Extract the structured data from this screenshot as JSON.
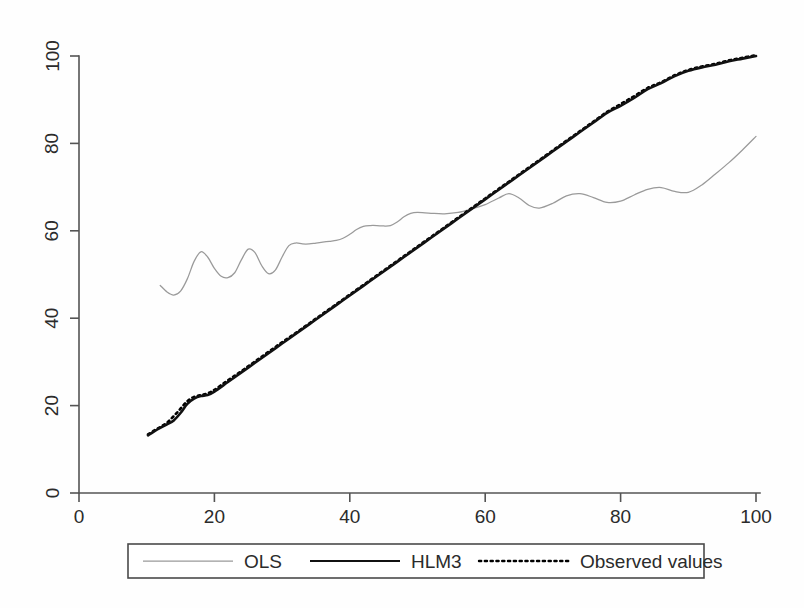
{
  "chart_data": {
    "type": "line",
    "title": "",
    "subtitle": "",
    "xlabel": "",
    "ylabel": "",
    "xlim": [
      0,
      100
    ],
    "ylim": [
      0,
      100
    ],
    "grid": false,
    "legend_position": "bottom-center",
    "x_ticks": [
      "0",
      "20",
      "40",
      "60",
      "80",
      "100"
    ],
    "y_ticks": [
      "0",
      "20",
      "40",
      "60",
      "80",
      "100"
    ],
    "x_tick_values": [
      0,
      20,
      40,
      60,
      80,
      100
    ],
    "y_tick_values": [
      0,
      20,
      40,
      60,
      80,
      100
    ],
    "series": [
      {
        "name": "OLS",
        "style": "thin-gray-solid",
        "color": "#9a9a9a",
        "x": [
          12.0,
          13.0,
          14.0,
          15.0,
          16.0,
          17.0,
          18.0,
          19.0,
          20.0,
          21.0,
          22.0,
          23.0,
          24.0,
          25.0,
          26.0,
          27.0,
          28.0,
          29.0,
          30.0,
          31.0,
          32.0,
          33.0,
          34.0,
          35.0,
          36.0,
          37.0,
          38.0,
          39.0,
          40.0,
          41.0,
          42.0,
          43.0,
          44.0,
          45.0,
          46.0,
          47.0,
          48.0,
          49.0,
          50.0,
          52.0,
          54.0,
          56.0,
          58.0,
          60.0,
          62.0,
          63.5,
          65.0,
          66.5,
          68.0,
          70.0,
          72.0,
          74.0,
          76.0,
          78.0,
          80.0,
          82.0,
          84.0,
          86.0,
          88.0,
          90.0,
          92.0,
          94.0,
          96.0,
          98.0,
          100.0
        ],
        "y": [
          47.5,
          46.0,
          45.3,
          46.2,
          49.0,
          53.0,
          55.2,
          54.0,
          51.4,
          49.6,
          49.3,
          50.4,
          53.4,
          55.8,
          55.0,
          52.0,
          50.2,
          51.0,
          54.0,
          56.6,
          57.2,
          57.0,
          57.0,
          57.2,
          57.4,
          57.6,
          57.8,
          58.3,
          59.2,
          60.3,
          61.0,
          61.2,
          61.2,
          61.1,
          61.2,
          62.0,
          63.2,
          64.0,
          64.2,
          64.0,
          63.9,
          64.2,
          65.0,
          66.0,
          67.5,
          68.5,
          67.5,
          65.8,
          65.2,
          66.3,
          68.0,
          68.5,
          67.6,
          66.5,
          66.8,
          68.2,
          69.5,
          69.9,
          69.0,
          68.8,
          70.5,
          73.0,
          75.6,
          78.5,
          81.6
        ]
      },
      {
        "name": "HLM3",
        "style": "thick-black-solid",
        "color": "#111111",
        "x": [
          10.2,
          11.0,
          12.0,
          13.0,
          14.0,
          15.0,
          16.0,
          17.0,
          18.0,
          19.0,
          20.0,
          22.0,
          24.0,
          26.0,
          28.0,
          30.0,
          32.0,
          34.0,
          36.0,
          38.0,
          40.0,
          42.0,
          44.0,
          46.0,
          48.0,
          50.0,
          52.0,
          54.0,
          56.0,
          58.0,
          60.0,
          62.0,
          64.0,
          66.0,
          68.0,
          70.0,
          72.0,
          74.0,
          76.0,
          78.0,
          80.0,
          82.0,
          84.0,
          86.0,
          88.0,
          90.0,
          92.0,
          94.0,
          96.0,
          98.0,
          100.0
        ],
        "y": [
          13.2,
          14.0,
          14.9,
          15.7,
          16.6,
          18.3,
          20.4,
          21.6,
          22.2,
          22.4,
          23.2,
          25.4,
          27.6,
          29.8,
          32.0,
          34.2,
          36.4,
          38.6,
          40.8,
          43.0,
          45.2,
          47.4,
          49.6,
          51.8,
          54.0,
          56.2,
          58.4,
          60.6,
          62.8,
          65.0,
          67.2,
          69.4,
          71.6,
          73.8,
          76.0,
          78.2,
          80.4,
          82.6,
          84.8,
          87.0,
          88.6,
          90.4,
          92.4,
          93.8,
          95.4,
          96.6,
          97.4,
          98.0,
          98.8,
          99.4,
          100.0
        ]
      },
      {
        "name": "Observed values",
        "style": "black-dotted",
        "color": "#000000",
        "x": [
          10.2,
          11.0,
          12.0,
          13.0,
          14.0,
          15.0,
          16.0,
          17.0,
          18.0,
          19.0,
          20.0,
          22.0,
          24.0,
          26.0,
          28.0,
          30.0,
          32.0,
          34.0,
          36.0,
          38.0,
          40.0,
          42.0,
          44.0,
          46.0,
          48.0,
          50.0,
          52.0,
          54.0,
          56.0,
          58.0,
          60.0,
          62.0,
          64.0,
          66.0,
          68.0,
          70.0,
          72.0,
          74.0,
          76.0,
          78.0,
          80.0,
          82.0,
          84.0,
          86.0,
          88.0,
          90.0,
          92.0,
          94.0,
          96.0,
          98.0,
          100.0
        ],
        "y": [
          13.4,
          14.2,
          15.1,
          16.1,
          17.6,
          19.3,
          21.0,
          22.0,
          22.4,
          22.8,
          23.6,
          25.8,
          27.9,
          30.1,
          32.3,
          34.5,
          36.6,
          38.8,
          41.0,
          43.2,
          45.4,
          47.6,
          49.8,
          52.0,
          54.2,
          56.4,
          58.6,
          60.8,
          63.0,
          65.2,
          67.4,
          69.6,
          71.8,
          74.0,
          76.2,
          78.4,
          80.6,
          82.8,
          85.0,
          87.2,
          89.0,
          90.8,
          92.7,
          94.0,
          95.6,
          96.8,
          97.6,
          98.2,
          99.0,
          99.6,
          100.2
        ]
      }
    ],
    "legend": [
      {
        "label": "OLS",
        "style": "thin-gray-solid"
      },
      {
        "label": "HLM3",
        "style": "thick-black-solid"
      },
      {
        "label": "Observed values",
        "style": "black-dotted"
      }
    ]
  },
  "colors": {
    "ols": "#9a9a9a",
    "hlm3": "#111111",
    "observed": "#000000",
    "axis": "#545454",
    "background": "#fefefe"
  }
}
